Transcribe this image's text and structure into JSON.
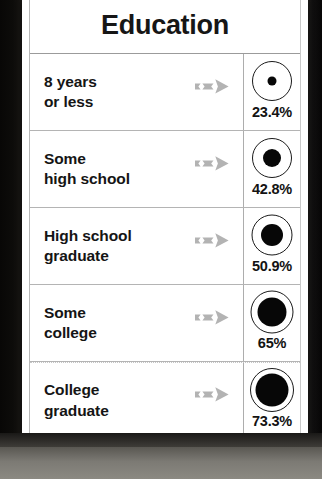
{
  "card": {
    "title": "Education",
    "columns": [
      "category",
      "arrow",
      "rate"
    ],
    "arrow_icon": "arrow-right-icon",
    "arrow_color": "#b3b3b3",
    "ring_color": "#1a1a1a",
    "dot_color": "#070707"
  },
  "chart_data": {
    "type": "bar",
    "title": "Education",
    "xlabel": "",
    "ylabel": "",
    "categories": [
      "8 years or less",
      "Some high school",
      "High school graduate",
      "Some college",
      "College graduate"
    ],
    "values": [
      23.4,
      42.8,
      50.9,
      65,
      73.3
    ],
    "value_labels": [
      "23.4%",
      "42.8%",
      "50.9%",
      "65%",
      "73.3%"
    ],
    "ylim": [
      0,
      100
    ],
    "grid": false,
    "legend": "none",
    "encoding": "proportional-area-dot-within-fixed-ring"
  },
  "rows": [
    {
      "label": "8 years\nor less",
      "value_label": "23.4%",
      "value": 23.4,
      "ring_px": 40,
      "dot_px": 9
    },
    {
      "label": "Some\nhigh school",
      "value_label": "42.8%",
      "value": 42.8,
      "ring_px": 40,
      "dot_px": 18
    },
    {
      "label": "High school\ngraduate",
      "value_label": "50.9%",
      "value": 50.9,
      "ring_px": 41,
      "dot_px": 22
    },
    {
      "label": "Some\ncollege",
      "value_label": "65%",
      "value": 65,
      "ring_px": 43,
      "dot_px": 29
    },
    {
      "label": "College\ngraduate",
      "value_label": "73.3%",
      "value": 73.3,
      "ring_px": 44,
      "dot_px": 33
    }
  ]
}
